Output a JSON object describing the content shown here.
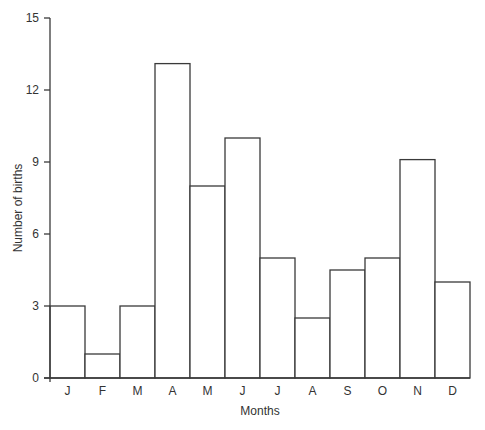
{
  "chart_data": {
    "type": "bar",
    "title": "",
    "xlabel": "Months",
    "ylabel": "Number of births",
    "categories": [
      "J",
      "F",
      "M",
      "A",
      "M",
      "J",
      "J",
      "A",
      "S",
      "O",
      "N",
      "D"
    ],
    "values": [
      3,
      1,
      3,
      13.1,
      8,
      10,
      5,
      2.5,
      4.5,
      5,
      9.1,
      4
    ],
    "ylim": [
      0,
      15
    ],
    "yticks": [
      0,
      3,
      6,
      9,
      12,
      15
    ],
    "ytick_labels": [
      "0",
      "3",
      "6",
      "9",
      "12",
      "15"
    ],
    "grid": false,
    "legend": "none",
    "bar_fill": "#ffffff",
    "bar_stroke": "#3a3a3a"
  }
}
